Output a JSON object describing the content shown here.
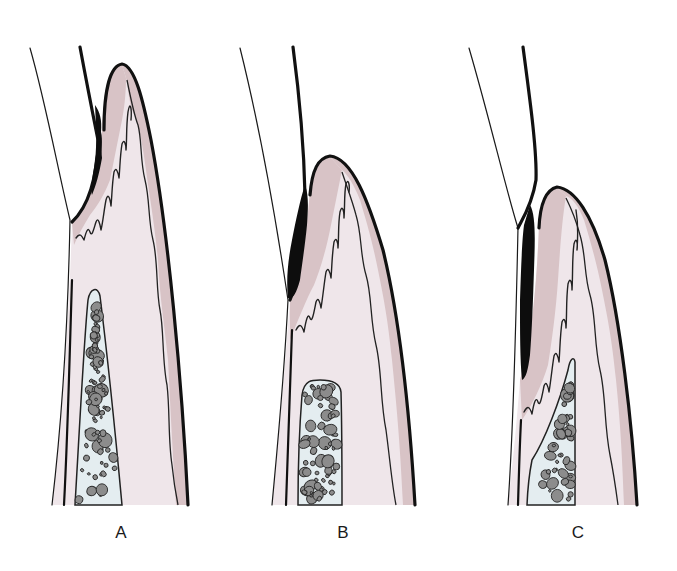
{
  "figure": {
    "type": "periodontal cross-section illustration",
    "colors": {
      "epithelium": "#d8c3c6",
      "connective_tissue": "#efe6ea",
      "bone": "#e4edf0",
      "calculus": "#0d0d0d",
      "outline": "#111111",
      "background": "#ffffff"
    },
    "panels": [
      {
        "id": "A",
        "label": "A"
      },
      {
        "id": "B",
        "label": "B"
      },
      {
        "id": "C",
        "label": "C"
      }
    ]
  }
}
